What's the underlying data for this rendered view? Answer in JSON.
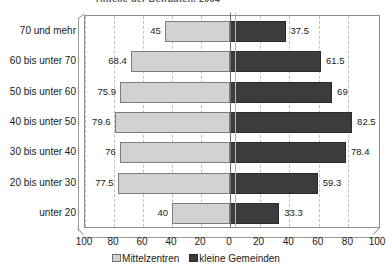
{
  "title_sliver": "Anteile der Befragten, 2004",
  "chart_data": {
    "type": "bar",
    "orientation": "horizontal",
    "style": "mirrored-bidirectional-pyramid",
    "title": "Anteile der Befragten, 2004",
    "xlabel": "",
    "ylabel": "",
    "grid": true,
    "legend_position": "bottom-center",
    "axis_ticks_left": [
      "100",
      "80",
      "60",
      "40",
      "20"
    ],
    "axis_ticks_center": "0",
    "axis_ticks_right": [
      "20",
      "40",
      "60",
      "80",
      "100"
    ],
    "xlim_left": [
      0,
      100
    ],
    "xlim_right": [
      0,
      100
    ],
    "categories": [
      "70 und mehr",
      "60 bis unter 70",
      "50 bis unter 60",
      "40 bis unter 50",
      "30 bis unter 40",
      "20 bis unter 30",
      "unter 20"
    ],
    "series": [
      {
        "name": "Mittelzentren",
        "side": "left",
        "color": "#d2d2d2",
        "values": [
          45,
          68.4,
          75.9,
          79.6,
          76,
          77.5,
          40
        ],
        "labels": [
          "45",
          "68.4",
          "75.9",
          "79.6",
          "76",
          "77.5",
          "40"
        ]
      },
      {
        "name": "kleine Gemeinden",
        "side": "right",
        "color": "#3c3c3c",
        "values": [
          37.5,
          61.5,
          69,
          82.5,
          78.4,
          59.3,
          33.3
        ],
        "labels": [
          "37.5",
          "61.5",
          "69",
          "82.5",
          "78.4",
          "59.3",
          "33.3"
        ]
      }
    ]
  },
  "legend": {
    "items": [
      {
        "label": "Mittelzentren",
        "color": "#d2d2d2"
      },
      {
        "label": "kleine Gemeinden",
        "color": "#3c3c3c"
      }
    ]
  }
}
